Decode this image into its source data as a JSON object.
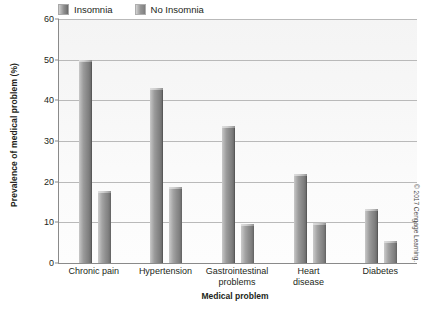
{
  "chart_data": {
    "type": "bar",
    "title": "",
    "xlabel": "Medical problem",
    "ylabel": "Prevalence of medical problem (%)",
    "categories": [
      "Chronic pain",
      "Hypertension",
      "Gastrointestinal problems",
      "Heart disease",
      "Diabetes"
    ],
    "category_lines": [
      [
        "Chronic pain"
      ],
      [
        "Hypertension"
      ],
      [
        "Gastrointestinal",
        "problems"
      ],
      [
        "Heart",
        "disease"
      ],
      [
        "Diabetes"
      ]
    ],
    "series": [
      {
        "name": "Insomnia",
        "values": [
          50.0,
          43.0,
          33.8,
          22.0,
          13.3
        ],
        "color": "#8b8b8b"
      },
      {
        "name": "No Insomnia",
        "values": [
          17.7,
          18.6,
          9.6,
          9.9,
          5.5
        ],
        "color": "#909090"
      }
    ],
    "ylim": [
      0,
      60
    ],
    "yticks": [
      0,
      10,
      20,
      30,
      40,
      50,
      60
    ],
    "ytick_labels": [
      "0",
      "10",
      "20",
      "30",
      "40",
      "50",
      "60"
    ],
    "grid": true,
    "legend_position": "top"
  },
  "legend": {
    "entries": [
      {
        "label": "Insomnia"
      },
      {
        "label": "No Insomnia"
      }
    ]
  },
  "credit": {
    "text": "© 2017 Cengage Learning."
  }
}
